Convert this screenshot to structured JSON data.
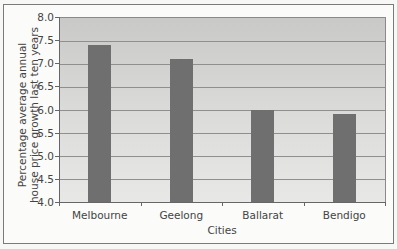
{
  "chart_data": {
    "type": "bar",
    "title": "",
    "xlabel": "Cities",
    "ylabel": "Percentage average annual house price growth last ten years",
    "ylabel_lines": [
      "Percentage average annual",
      "house price growth last ten years"
    ],
    "categories": [
      "Melbourne",
      "Geelong",
      "Ballarat",
      "Bendigo"
    ],
    "values": [
      7.4,
      7.1,
      6.0,
      5.9
    ],
    "ylim": [
      4.0,
      8.0
    ],
    "yticks": [
      "8.0",
      "7.5",
      "7.0",
      "6.5",
      "6.0",
      "5.5",
      "5.0",
      "4.5",
      "4.0"
    ],
    "grid": true,
    "legend": null,
    "colors": {
      "bar": "#6f6f6f",
      "plot_bg_top": "#c9c9c7",
      "plot_bg_bottom": "#e8e8e6",
      "gridline": "#8f8f8f"
    }
  }
}
